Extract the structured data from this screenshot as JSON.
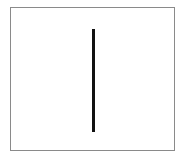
{
  "figure": {
    "frame": {
      "border_color": "#8a8a8a",
      "background": "#ffffff"
    },
    "shapes": [
      {
        "type": "vertical-line",
        "color": "#111111"
      }
    ]
  }
}
